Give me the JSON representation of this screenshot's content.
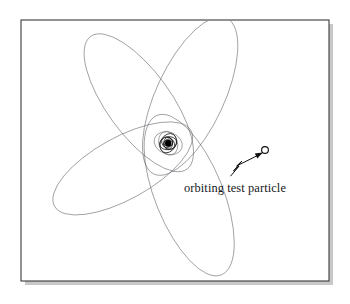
{
  "figure": {
    "kind": "orbital-diagram",
    "title": "",
    "background_color": "#ffffff",
    "frame": {
      "x": 21,
      "y": 20,
      "width": 308,
      "height": 261,
      "stroke_color": "#3a3a3a",
      "fill_color": "#ffffff",
      "shadow_color": "#9a9a9a"
    },
    "annotations": [
      {
        "name": "orbiting-test-particle-label",
        "text": "orbiting test particle",
        "x": 184,
        "y": 192,
        "font_size": 12.4,
        "color": "#17171b"
      }
    ],
    "markers": [
      {
        "name": "central-mass",
        "shape": "filled-circle",
        "cx": 168.2,
        "cy": 143.2,
        "r": 3.2,
        "color": "#000000"
      },
      {
        "name": "test-particle",
        "shape": "open-circle",
        "cx": 265.0,
        "cy": 150.0,
        "r": 3.4,
        "stroke_color": "#111111",
        "fill_color": "#ffffff"
      }
    ],
    "pointer": {
      "name": "squiggle-arrow",
      "tail_x": 230.5,
      "tail_y": 176.0,
      "tip_x": 261.5,
      "tip_y": 153.5,
      "color": "#111111"
    },
    "orbit": {
      "type": "precessing-rosette",
      "center_x": 168.2,
      "center_y": 143.2,
      "stroke_color": "#55555c",
      "stroke_width": 0.55,
      "lobes": [
        {
          "name": "lobe-upper-left",
          "rx": 32,
          "ry": 82,
          "cx": -25,
          "cy": -45,
          "rotation_deg": -36
        },
        {
          "name": "lobe-upper-right",
          "rx": 34,
          "ry": 86,
          "cx": 26,
          "cy": -42,
          "rotation_deg": 25
        },
        {
          "name": "lobe-lower-left",
          "rx": 34,
          "ry": 86,
          "cx": -26,
          "cy": 48,
          "rotation_deg": -22
        },
        {
          "name": "lobe-lower-right",
          "rx": 31,
          "ry": 78,
          "cx": 42,
          "cy": 32,
          "rotation_deg": 61
        }
      ],
      "inner_spiral_rings": [
        {
          "rx": 14.5,
          "ry": 11.0,
          "rotation_deg": 20
        },
        {
          "rx": 12.2,
          "ry": 9.2,
          "rotation_deg": 70
        },
        {
          "rx": 10.2,
          "ry": 7.7,
          "rotation_deg": 120
        },
        {
          "rx": 8.6,
          "ry": 6.5,
          "rotation_deg": 170
        },
        {
          "rx": 7.2,
          "ry": 5.4,
          "rotation_deg": 220
        },
        {
          "rx": 6.0,
          "ry": 4.5,
          "rotation_deg": 270
        },
        {
          "rx": 5.0,
          "ry": 3.8,
          "rotation_deg": 320
        },
        {
          "rx": 4.2,
          "ry": 3.2,
          "rotation_deg": 10
        }
      ]
    }
  }
}
